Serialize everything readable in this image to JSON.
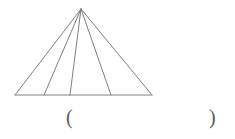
{
  "page": {
    "background_color": "#ffffff",
    "width": 235,
    "height": 139
  },
  "figure": {
    "name": "triangle-with-cevians",
    "stroke_color": "#808080",
    "stroke_width": 1,
    "fill": "none",
    "apex": {
      "x": 81,
      "y": 9
    },
    "base_left": {
      "x": 15,
      "y": 95
    },
    "base_right": {
      "x": 152,
      "y": 95
    },
    "cevian_feet": [
      {
        "x": 44,
        "y": 95
      },
      {
        "x": 70,
        "y": 95
      },
      {
        "x": 111,
        "y": 95
      }
    ],
    "triangle_count_label": "",
    "segment_count": 4,
    "cevian_count": 3
  },
  "answer": {
    "open_paren": "(",
    "close_paren": ")",
    "value": "",
    "placeholder": ""
  }
}
